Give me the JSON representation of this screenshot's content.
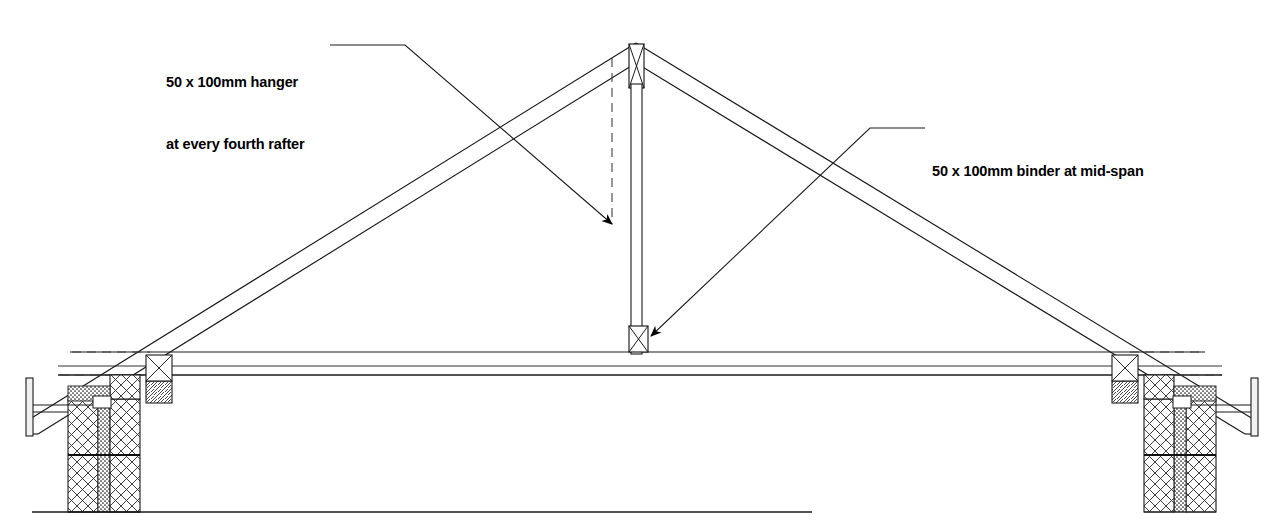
{
  "drawing": {
    "title": "Roof truss section detail",
    "type": "architectural-section",
    "line_color": "#1a1a1a",
    "fill_color": "#ffffff",
    "background": "#ffffff"
  },
  "annotations": [
    {
      "id": "hanger",
      "line1": "50 x 100mm hanger",
      "line2": "at every fourth rafter",
      "text": "50 x 100mm hanger at every fourth rafter",
      "leader_from": [
        330,
        45
      ],
      "leader_elbow": [
        405,
        45
      ],
      "leader_to": [
        612,
        224
      ],
      "arrow": "filled-triangle"
    },
    {
      "id": "binder",
      "line1": "50 x 100mm binder at mid-span",
      "line2": "",
      "text": "50 x 100mm binder at mid-span",
      "leader_from": [
        925,
        128
      ],
      "leader_elbow": [
        870,
        128
      ],
      "leader_to": [
        647,
        338
      ],
      "arrow": "filled-triangle"
    }
  ],
  "components": {
    "apex": {
      "label": "truss apex joint",
      "x": 636,
      "y": 44
    },
    "hanger_post": {
      "label": "50 x 100mm hanger post",
      "x": 636,
      "top": 48,
      "bottom": 352
    },
    "binder_block": {
      "label": "50 x 100mm binder",
      "x": 636,
      "y": 338
    },
    "ceiling_tie": {
      "label": "ceiling tie",
      "y": 352
    },
    "left_wall": {
      "label": "left cavity wall",
      "x": 70
    },
    "right_wall": {
      "label": "right cavity wall",
      "x": 1160
    },
    "left_fascia": {
      "label": "left fascia board",
      "x": 30
    },
    "right_fascia": {
      "label": "right fascia board",
      "x": 1243
    },
    "rafter_left": {
      "label": "left rafter"
    },
    "rafter_right": {
      "label": "right rafter"
    },
    "baseline_rule": {
      "label": "drawing baseline rule",
      "x1": 32,
      "x2": 812,
      "y": 512
    }
  },
  "hatch_patterns": {
    "masonry": "diagonal-crosshatch",
    "timber": "diagonal-hatch",
    "insulation": "stipple-dense"
  }
}
